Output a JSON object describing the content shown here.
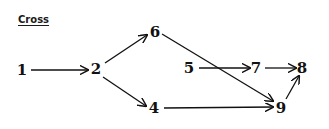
{
  "title": "Cross",
  "colors": {
    "ink": "#111111",
    "background": "#ffffff"
  },
  "nodes": [
    {
      "id": "1",
      "label": "1",
      "x": 22,
      "y": 70
    },
    {
      "id": "2",
      "label": "2",
      "x": 96,
      "y": 69
    },
    {
      "id": "6",
      "label": "6",
      "x": 155,
      "y": 32
    },
    {
      "id": "4",
      "label": "4",
      "x": 154,
      "y": 108
    },
    {
      "id": "5",
      "label": "5",
      "x": 189,
      "y": 68
    },
    {
      "id": "7",
      "label": "7",
      "x": 256,
      "y": 68
    },
    {
      "id": "8",
      "label": "8",
      "x": 302,
      "y": 68
    },
    {
      "id": "9",
      "label": "9",
      "x": 281,
      "y": 108
    }
  ],
  "edges": [
    {
      "from": "1",
      "to": "2"
    },
    {
      "from": "2",
      "to": "6"
    },
    {
      "from": "2",
      "to": "4"
    },
    {
      "from": "6",
      "to": "9"
    },
    {
      "from": "5",
      "to": "7"
    },
    {
      "from": "7",
      "to": "8"
    },
    {
      "from": "4",
      "to": "9"
    },
    {
      "from": "9",
      "to": "8"
    }
  ]
}
